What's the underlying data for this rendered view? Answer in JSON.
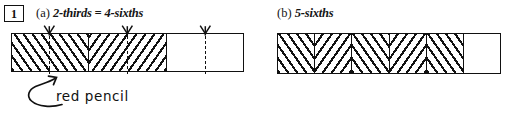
{
  "exercise": {
    "number": "1"
  },
  "parts": [
    {
      "tag": "(a)",
      "label": "2-thirds = 4-sixths",
      "bar": {
        "total_cells": 3,
        "shaded_cells": 2,
        "cells": [
          {
            "fill": "hatch-fwd",
            "divider": true
          },
          {
            "fill": "hatch-bwd",
            "divider": true
          },
          {
            "fill": "blank",
            "divider": false
          }
        ],
        "sixth_marks": [
          0.1667,
          0.5,
          0.8333
        ],
        "sixth_marks_count": 3
      }
    },
    {
      "tag": "(b)",
      "label": "5-sixths",
      "bar": {
        "total_cells": 6,
        "shaded_cells": 5,
        "cells": [
          {
            "fill": "hatch-fwd",
            "divider": true
          },
          {
            "fill": "hatch-bwd",
            "divider": true
          },
          {
            "fill": "hatch-fwd",
            "divider": true
          },
          {
            "fill": "hatch-bwd",
            "divider": true
          },
          {
            "fill": "hatch-fwd",
            "divider": true
          },
          {
            "fill": "blank",
            "divider": false
          }
        ]
      }
    }
  ],
  "annotation": {
    "text": "red pencil",
    "kind": "handwritten-arrow-callout"
  },
  "colors": {
    "ink": "#111111",
    "paper": "#ffffff"
  }
}
